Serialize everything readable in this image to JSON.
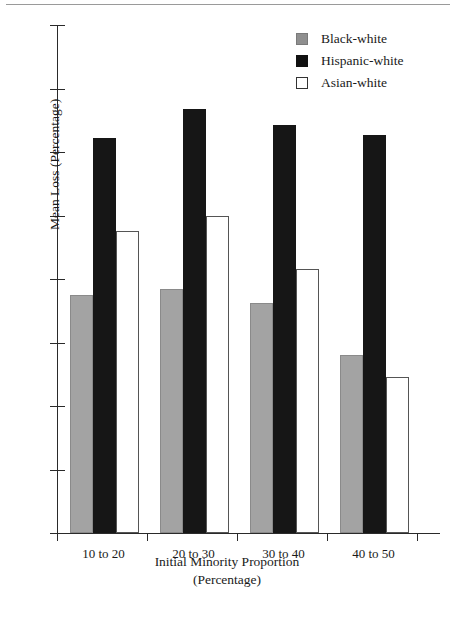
{
  "chart_data": {
    "type": "bar",
    "title": "",
    "xlabel": "Initial Minority Proportion (Percentage)",
    "xlabel_line1": "Initial Minority Proportion",
    "xlabel_line2": "(Percentage)",
    "ylabel": "Mean Loss (Percentage)",
    "categories": [
      "10 to 20",
      "20 to 30",
      "30 to 40",
      "40 to 50"
    ],
    "series": [
      {
        "name": "Black-white",
        "color": "#a3a3a3",
        "values": [
          7.5,
          7.7,
          7.25,
          5.6
        ]
      },
      {
        "name": "Hispanic-white",
        "color": "#161616",
        "values": [
          12.45,
          13.35,
          12.85,
          12.55
        ]
      },
      {
        "name": "Asian-white",
        "color": "#ffffff",
        "values": [
          9.5,
          10.0,
          8.3,
          4.9
        ]
      }
    ],
    "ylim": [
      0,
      16
    ],
    "yticks": [
      0,
      2,
      4,
      6,
      8,
      10,
      12,
      14,
      16
    ],
    "ytick_labels": [
      "0",
      "2",
      "4",
      "6",
      "8",
      "10",
      "12",
      "14",
      "16"
    ],
    "grid": false,
    "legend_position": "top-right"
  },
  "legend": {
    "items": [
      {
        "label": "Black-white",
        "swatch": "gray-square-swatch"
      },
      {
        "label": "Hispanic-white",
        "swatch": "black-square-swatch"
      },
      {
        "label": "Asian-white",
        "swatch": "white-square-swatch"
      }
    ]
  },
  "colors": {
    "black_white_bar": "#a3a3a3",
    "hispanic_white_bar": "#161616",
    "asian_white_bar": "#ffffff",
    "axis": "#2a2a2a",
    "text": "#1a1a1a",
    "top_rule": "#9a9a9a"
  }
}
